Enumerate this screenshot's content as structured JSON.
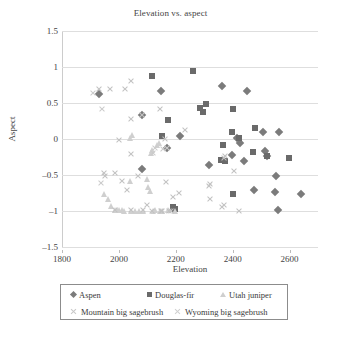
{
  "chart_data": {
    "type": "scatter",
    "title": "Elevation vs. aspect",
    "xlabel": "Elevation",
    "ylabel": "Aspect",
    "xlim": [
      1800,
      2700
    ],
    "ylim": [
      -1.5,
      1.5
    ],
    "xticks": [
      1800,
      2000,
      2200,
      2400,
      2600
    ],
    "yticks": [
      1.5,
      1,
      0.5,
      0,
      -0.5,
      -1,
      -1.5
    ],
    "ytick_labels": [
      "1.5",
      "1",
      "0.5",
      "0",
      "–0.5",
      "–1",
      "–1.5"
    ],
    "grid": "horizontal",
    "legend_position": "bottom",
    "colors": {
      "aspen": "#7b7b7b",
      "douglas_fir": "#6a6a6a",
      "utah_juniper": "#cfcfcf",
      "mountain_big_sagebrush": "#c2c2c2",
      "wyoming_big_sagebrush": "#cbcbcb",
      "gridline": "#dedede",
      "legend_border": "#8c8c8c",
      "text": "#444444"
    },
    "series": [
      {
        "name": "Aspen",
        "marker": "diamond",
        "points": [
          [
            1930,
            0.63
          ],
          [
            2080,
            0.33
          ],
          [
            2148,
            0.67
          ],
          [
            2216,
            0.04
          ],
          [
            2080,
            -0.42
          ],
          [
            2168,
            -0.12
          ],
          [
            2318,
            -0.36
          ],
          [
            2362,
            0.74
          ],
          [
            2415,
            0.02
          ],
          [
            2425,
            -0.05
          ],
          [
            2440,
            -0.3
          ],
          [
            2450,
            0.66
          ],
          [
            2398,
            -0.22
          ],
          [
            2512,
            -0.17
          ],
          [
            2508,
            0.1
          ],
          [
            2476,
            -0.71
          ],
          [
            2548,
            -0.73
          ],
          [
            2552,
            -0.51
          ],
          [
            2558,
            -0.98
          ],
          [
            2562,
            0.1
          ],
          [
            2640,
            -0.76
          ],
          [
            2520,
            -0.24
          ]
        ]
      },
      {
        "name": "Douglas-fir",
        "marker": "square",
        "points": [
          [
            2118,
            0.87
          ],
          [
            2150,
            0.04
          ],
          [
            2172,
            0.26
          ],
          [
            2262,
            0.94
          ],
          [
            2286,
            0.43
          ],
          [
            2296,
            0.38
          ],
          [
            2306,
            0.48
          ],
          [
            2366,
            -0.08
          ],
          [
            2372,
            -0.3
          ],
          [
            2396,
            0.1
          ],
          [
            2400,
            0.42
          ],
          [
            2422,
            0.02
          ],
          [
            2402,
            -0.76
          ],
          [
            2472,
            -0.18
          ],
          [
            2480,
            0.15
          ],
          [
            2522,
            -0.24
          ],
          [
            2598,
            -0.27
          ],
          [
            2196,
            -0.97
          ],
          [
            2190,
            -0.95
          ],
          [
            2360,
            -0.29
          ]
        ]
      },
      {
        "name": "Utah juniper",
        "marker": "triangle",
        "points": [
          [
            1948,
            -0.76
          ],
          [
            1960,
            -0.84
          ],
          [
            1972,
            -0.93
          ],
          [
            1985,
            -0.99
          ],
          [
            1995,
            -0.99
          ],
          [
            2002,
            -0.99
          ],
          [
            2010,
            -0.99
          ],
          [
            2018,
            -1.0
          ],
          [
            2040,
            -0.59
          ],
          [
            2042,
            -1.0
          ],
          [
            2056,
            -1.0
          ],
          [
            2072,
            -1.0
          ],
          [
            2086,
            -1.0
          ],
          [
            2100,
            -0.55
          ],
          [
            2104,
            -0.66
          ],
          [
            2108,
            -0.72
          ],
          [
            2112,
            -0.2
          ],
          [
            2116,
            -0.15
          ],
          [
            2120,
            -1.0
          ],
          [
            2126,
            -0.99
          ],
          [
            2134,
            -0.09
          ],
          [
            2140,
            -0.06
          ],
          [
            2146,
            -1.0
          ],
          [
            2150,
            -1.0
          ],
          [
            2172,
            -0.99
          ],
          [
            2196,
            -1.0
          ],
          [
            2040,
            0.02
          ],
          [
            2046,
            0.06
          ]
        ]
      },
      {
        "name": "Mountain big sagebrush",
        "marker": "x",
        "points": [
          [
            1930,
            0.7
          ],
          [
            1968,
            0.7
          ],
          [
            2020,
            0.7
          ],
          [
            2044,
            0.81
          ],
          [
            2000,
            -0.02
          ],
          [
            2042,
            0.28
          ],
          [
            2044,
            -0.21
          ],
          [
            2082,
            0.33
          ],
          [
            2146,
            0.42
          ],
          [
            2162,
            0.0
          ],
          [
            2232,
            0.12
          ],
          [
            1948,
            -0.47
          ],
          [
            1950,
            -0.51
          ],
          [
            1988,
            -0.47
          ],
          [
            2012,
            -0.59
          ],
          [
            2028,
            -0.71
          ],
          [
            2068,
            -0.52
          ],
          [
            2164,
            -0.6
          ],
          [
            2190,
            -0.8
          ],
          [
            2212,
            -0.75
          ],
          [
            2318,
            -0.65
          ],
          [
            2322,
            -0.62
          ],
          [
            2320,
            -0.83
          ],
          [
            2362,
            -0.94
          ],
          [
            2370,
            -0.91
          ],
          [
            2424,
            -1.0
          ],
          [
            2404,
            -0.45
          ],
          [
            2368,
            -0.27
          ],
          [
            2372,
            -0.24
          ],
          [
            2176,
            -1.0
          ],
          [
            2182,
            -1.0
          ],
          [
            2148,
            -1.0
          ],
          [
            2152,
            -1.0
          ],
          [
            2116,
            -1.0
          ],
          [
            2098,
            -0.92
          ],
          [
            2086,
            -0.99
          ],
          [
            1985,
            -0.99
          ],
          [
            2044,
            -0.99
          ]
        ]
      },
      {
        "name": "Wyoming big sagebrush",
        "marker": "x-small",
        "points": [
          [
            1908,
            0.64
          ],
          [
            1940,
            0.41
          ],
          [
            1938,
            -0.61
          ],
          [
            2120,
            -0.19
          ],
          [
            2128,
            -0.13
          ],
          [
            2168,
            -0.13
          ],
          [
            2156,
            -0.14
          ]
        ]
      }
    ]
  },
  "legend": {
    "entries": [
      {
        "label": "Aspen",
        "marker": "diamond"
      },
      {
        "label": "Douglas-fir",
        "marker": "square"
      },
      {
        "label": "Utah juniper",
        "marker": "triangle"
      },
      {
        "label": "Mountain big sagebrush",
        "marker": "x"
      },
      {
        "label": "Wyoming big sagebrush",
        "marker": "x-small"
      }
    ]
  }
}
